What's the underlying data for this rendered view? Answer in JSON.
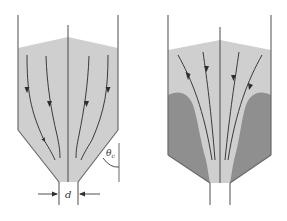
{
  "figure": {
    "panels": [
      {
        "id": "mass-flow",
        "description": "Mass flow silo: all material moving downward along flow lines",
        "labels": {
          "outlet_diameter": "d",
          "hopper_angle": "θ",
          "hopper_angle_subscript": "c"
        }
      },
      {
        "id": "funnel-flow",
        "description": "Funnel (core) flow silo with stagnant zones near walls",
        "labels": {}
      }
    ],
    "colors": {
      "background": "#ffffff",
      "bulk_material": "#cfcfcf",
      "stagnant_zone": "#8f8f8f",
      "lines": "#3a3a3a",
      "walls": "#6a6a6a"
    }
  }
}
